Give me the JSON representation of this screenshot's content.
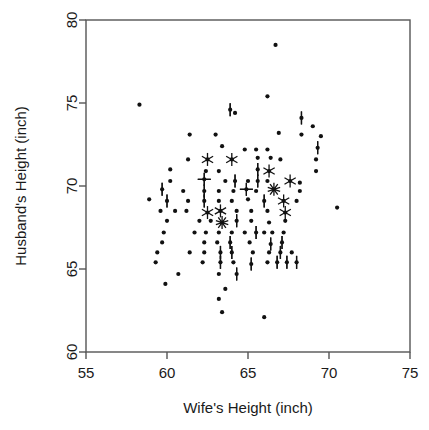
{
  "top_clipped_text": "",
  "chart_data": {
    "type": "scatter",
    "variant": "sunflower",
    "title": "",
    "xlabel": "Wife's Height (inch)",
    "ylabel": "Husband's Height (inch)",
    "xlim": [
      55,
      75
    ],
    "ylim": [
      60,
      80
    ],
    "xticks": [
      55,
      60,
      65,
      70,
      75
    ],
    "yticks": [
      60,
      65,
      70,
      75,
      80
    ],
    "xtick_labels": [
      "55",
      "60",
      "65",
      "70",
      "75"
    ],
    "ytick_labels": [
      "60",
      "65",
      "70",
      "75",
      "80"
    ],
    "grid": false,
    "legend": null,
    "point_color": "#111111",
    "frame_color": "#555555",
    "points": [
      {
        "x": 58.3,
        "y": 74.9,
        "n": 1
      },
      {
        "x": 66.7,
        "y": 78.5,
        "n": 1
      },
      {
        "x": 66.2,
        "y": 75.4,
        "n": 1
      },
      {
        "x": 63.9,
        "y": 74.6,
        "n": 2
      },
      {
        "x": 64.2,
        "y": 74.4,
        "n": 1
      },
      {
        "x": 68.3,
        "y": 74.1,
        "n": 2
      },
      {
        "x": 69.0,
        "y": 73.6,
        "n": 1
      },
      {
        "x": 61.4,
        "y": 73.1,
        "n": 1
      },
      {
        "x": 63.0,
        "y": 73.1,
        "n": 1
      },
      {
        "x": 66.9,
        "y": 73.2,
        "n": 1
      },
      {
        "x": 68.3,
        "y": 73.1,
        "n": 1
      },
      {
        "x": 69.5,
        "y": 73.0,
        "n": 1
      },
      {
        "x": 63.4,
        "y": 72.4,
        "n": 1
      },
      {
        "x": 64.8,
        "y": 72.2,
        "n": 1
      },
      {
        "x": 65.5,
        "y": 72.2,
        "n": 1
      },
      {
        "x": 66.2,
        "y": 72.2,
        "n": 1
      },
      {
        "x": 69.3,
        "y": 72.3,
        "n": 2
      },
      {
        "x": 61.3,
        "y": 71.6,
        "n": 1
      },
      {
        "x": 62.5,
        "y": 71.6,
        "n": 3
      },
      {
        "x": 64.0,
        "y": 71.6,
        "n": 3
      },
      {
        "x": 65.6,
        "y": 71.7,
        "n": 1
      },
      {
        "x": 66.4,
        "y": 71.7,
        "n": 1
      },
      {
        "x": 67.0,
        "y": 71.6,
        "n": 1
      },
      {
        "x": 69.2,
        "y": 71.6,
        "n": 1
      },
      {
        "x": 60.2,
        "y": 71.0,
        "n": 1
      },
      {
        "x": 62.4,
        "y": 70.9,
        "n": 1
      },
      {
        "x": 63.2,
        "y": 70.9,
        "n": 1
      },
      {
        "x": 65.6,
        "y": 71.0,
        "n": 2
      },
      {
        "x": 66.3,
        "y": 70.9,
        "n": 3
      },
      {
        "x": 69.2,
        "y": 70.9,
        "n": 1
      },
      {
        "x": 60.2,
        "y": 70.3,
        "n": 1
      },
      {
        "x": 62.3,
        "y": 70.4,
        "n": 4
      },
      {
        "x": 63.6,
        "y": 70.3,
        "n": 1
      },
      {
        "x": 64.2,
        "y": 70.3,
        "n": 2
      },
      {
        "x": 65.0,
        "y": 70.3,
        "n": 1
      },
      {
        "x": 65.6,
        "y": 70.3,
        "n": 2
      },
      {
        "x": 66.2,
        "y": 70.3,
        "n": 1
      },
      {
        "x": 67.6,
        "y": 70.3,
        "n": 3
      },
      {
        "x": 68.2,
        "y": 70.2,
        "n": 1
      },
      {
        "x": 59.7,
        "y": 69.8,
        "n": 2
      },
      {
        "x": 61.0,
        "y": 69.7,
        "n": 1
      },
      {
        "x": 62.3,
        "y": 69.7,
        "n": 2
      },
      {
        "x": 63.2,
        "y": 69.7,
        "n": 1
      },
      {
        "x": 64.1,
        "y": 69.7,
        "n": 1
      },
      {
        "x": 64.9,
        "y": 69.8,
        "n": 4
      },
      {
        "x": 65.5,
        "y": 69.7,
        "n": 1
      },
      {
        "x": 66.6,
        "y": 69.8,
        "n": 5
      },
      {
        "x": 68.2,
        "y": 69.7,
        "n": 1
      },
      {
        "x": 58.9,
        "y": 69.2,
        "n": 1
      },
      {
        "x": 60.0,
        "y": 69.1,
        "n": 2
      },
      {
        "x": 61.3,
        "y": 69.1,
        "n": 1
      },
      {
        "x": 62.3,
        "y": 69.1,
        "n": 2
      },
      {
        "x": 63.2,
        "y": 69.1,
        "n": 1
      },
      {
        "x": 64.0,
        "y": 69.1,
        "n": 1
      },
      {
        "x": 65.0,
        "y": 69.2,
        "n": 1
      },
      {
        "x": 66.0,
        "y": 69.1,
        "n": 2
      },
      {
        "x": 67.2,
        "y": 69.1,
        "n": 3
      },
      {
        "x": 68.0,
        "y": 69.1,
        "n": 1
      },
      {
        "x": 70.5,
        "y": 68.7,
        "n": 1
      },
      {
        "x": 59.6,
        "y": 68.5,
        "n": 1
      },
      {
        "x": 60.5,
        "y": 68.5,
        "n": 1
      },
      {
        "x": 61.2,
        "y": 68.5,
        "n": 1
      },
      {
        "x": 62.5,
        "y": 68.4,
        "n": 3
      },
      {
        "x": 63.3,
        "y": 68.5,
        "n": 3
      },
      {
        "x": 64.3,
        "y": 68.5,
        "n": 1
      },
      {
        "x": 65.2,
        "y": 68.5,
        "n": 1
      },
      {
        "x": 66.2,
        "y": 68.5,
        "n": 1
      },
      {
        "x": 67.3,
        "y": 68.4,
        "n": 3
      },
      {
        "x": 60.0,
        "y": 67.9,
        "n": 1
      },
      {
        "x": 62.0,
        "y": 67.9,
        "n": 1
      },
      {
        "x": 62.7,
        "y": 67.9,
        "n": 1
      },
      {
        "x": 63.4,
        "y": 67.8,
        "n": 5
      },
      {
        "x": 64.3,
        "y": 67.9,
        "n": 2
      },
      {
        "x": 65.2,
        "y": 67.9,
        "n": 1
      },
      {
        "x": 66.3,
        "y": 67.8,
        "n": 1
      },
      {
        "x": 67.3,
        "y": 67.9,
        "n": 1
      },
      {
        "x": 59.8,
        "y": 67.2,
        "n": 1
      },
      {
        "x": 61.7,
        "y": 67.2,
        "n": 1
      },
      {
        "x": 62.4,
        "y": 67.2,
        "n": 1
      },
      {
        "x": 63.2,
        "y": 67.2,
        "n": 1
      },
      {
        "x": 64.0,
        "y": 67.2,
        "n": 1
      },
      {
        "x": 64.8,
        "y": 67.2,
        "n": 1
      },
      {
        "x": 65.5,
        "y": 67.2,
        "n": 2
      },
      {
        "x": 66.0,
        "y": 67.2,
        "n": 1
      },
      {
        "x": 66.5,
        "y": 67.2,
        "n": 1
      },
      {
        "x": 67.2,
        "y": 67.2,
        "n": 1
      },
      {
        "x": 59.7,
        "y": 66.6,
        "n": 1
      },
      {
        "x": 62.3,
        "y": 66.6,
        "n": 1
      },
      {
        "x": 63.1,
        "y": 66.6,
        "n": 1
      },
      {
        "x": 63.9,
        "y": 66.6,
        "n": 2
      },
      {
        "x": 65.1,
        "y": 66.6,
        "n": 1
      },
      {
        "x": 66.4,
        "y": 66.5,
        "n": 2
      },
      {
        "x": 67.1,
        "y": 66.6,
        "n": 2
      },
      {
        "x": 59.4,
        "y": 66.0,
        "n": 1
      },
      {
        "x": 61.4,
        "y": 66.0,
        "n": 1
      },
      {
        "x": 62.3,
        "y": 66.0,
        "n": 1
      },
      {
        "x": 63.3,
        "y": 66.0,
        "n": 2
      },
      {
        "x": 64.0,
        "y": 66.0,
        "n": 2
      },
      {
        "x": 65.3,
        "y": 66.0,
        "n": 1
      },
      {
        "x": 66.3,
        "y": 66.0,
        "n": 1
      },
      {
        "x": 67.0,
        "y": 66.0,
        "n": 2
      },
      {
        "x": 67.7,
        "y": 66.0,
        "n": 1
      },
      {
        "x": 59.3,
        "y": 65.4,
        "n": 1
      },
      {
        "x": 62.2,
        "y": 65.4,
        "n": 1
      },
      {
        "x": 63.3,
        "y": 65.4,
        "n": 2
      },
      {
        "x": 64.1,
        "y": 65.4,
        "n": 1
      },
      {
        "x": 65.2,
        "y": 65.3,
        "n": 2
      },
      {
        "x": 66.2,
        "y": 65.4,
        "n": 1
      },
      {
        "x": 66.8,
        "y": 65.4,
        "n": 2
      },
      {
        "x": 67.4,
        "y": 65.4,
        "n": 2
      },
      {
        "x": 68.0,
        "y": 65.4,
        "n": 2
      },
      {
        "x": 60.7,
        "y": 64.7,
        "n": 1
      },
      {
        "x": 63.2,
        "y": 64.7,
        "n": 1
      },
      {
        "x": 64.3,
        "y": 64.7,
        "n": 2
      },
      {
        "x": 59.9,
        "y": 64.1,
        "n": 1
      },
      {
        "x": 63.6,
        "y": 63.8,
        "n": 1
      },
      {
        "x": 63.2,
        "y": 63.2,
        "n": 1
      },
      {
        "x": 66.0,
        "y": 62.1,
        "n": 1
      },
      {
        "x": 63.4,
        "y": 62.4,
        "n": 1
      }
    ]
  }
}
